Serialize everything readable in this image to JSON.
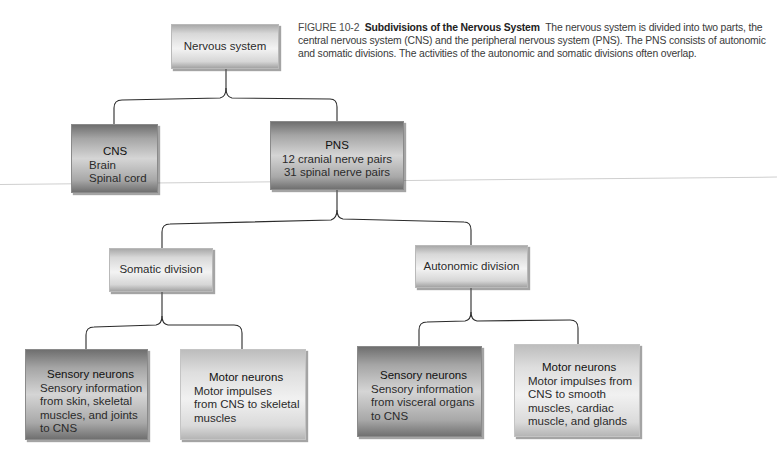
{
  "caption": {
    "figure_label": "FIGURE 10-2",
    "title": "Subdivisions of the Nervous System",
    "text": "The nervous system is divided into two parts, the central nervous system (CNS) and the peripheral nervous system (PNS). The PNS consists of autonomic and somatic divisions. The activities of the autonomic and somatic divisions often overlap."
  },
  "nodes": {
    "root": {
      "label": "Nervous system"
    },
    "cns": {
      "title": "CNS",
      "lines": [
        "Brain",
        "Spinal cord"
      ]
    },
    "pns": {
      "title": "PNS",
      "lines": [
        "12 cranial nerve pairs",
        "31 spinal nerve pairs"
      ]
    },
    "somatic": {
      "label": "Somatic division"
    },
    "autonomic": {
      "label": "Autonomic division"
    },
    "somatic_sensory": {
      "title": "Sensory neurons",
      "lines": [
        "Sensory information",
        "from skin, skeletal",
        "muscles, and joints",
        "to CNS"
      ]
    },
    "somatic_motor": {
      "title": "Motor neurons",
      "lines": [
        "Motor impulses",
        "from CNS to skeletal",
        "muscles"
      ]
    },
    "autonomic_sensory": {
      "title": "Sensory neurons",
      "lines": [
        "Sensory information",
        "from visceral organs",
        "to CNS"
      ]
    },
    "autonomic_motor": {
      "title": "Motor neurons",
      "lines": [
        "Motor impulses from",
        "CNS to smooth",
        "muscles, cardiac",
        "muscle, and glands"
      ]
    }
  },
  "colors": {
    "connector": "#2b2b2b",
    "dark_box": "#a5a5a5",
    "light_box": "#e6e6e6"
  }
}
